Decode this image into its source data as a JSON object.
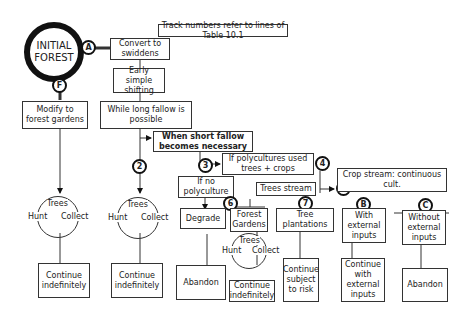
{
  "note": "Track numbers refer to lines of Table 10.1",
  "start": "INITIAL FOREST",
  "markers": {
    "A": "A",
    "F": "F",
    "n2": "2",
    "n3": "3",
    "n4": "4",
    "n5": "5",
    "n6": "6",
    "n7": "7",
    "B": "B",
    "C": "C"
  },
  "boxes": {
    "convert": "Convert to swiddens",
    "early": "Early simple shifting",
    "modify": "Modify to forest gardens",
    "long_fallow": "While long fallow is possible",
    "short_fallow": "When short fallow becomes necessary",
    "polycultures": "If polycultures used trees + crops",
    "no_poly": "If no polyculture",
    "trees_stream": "Trees stream",
    "crop_stream": "Crop stream: continuous cult.",
    "degrade": "Degrade",
    "forest_gardens": "Forest Gardens",
    "tree_plantations": "Tree plantations",
    "with_inputs": "With external inputs",
    "without_inputs": "Without external inputs",
    "continue1": "Continue indefinitely",
    "continue2": "Continue indefinitely",
    "abandon1": "Abandon",
    "continue3": "Continue indefinitely",
    "continue_risk": "Continue subject to risk",
    "continue_inputs": "Continue with external inputs",
    "abandon2": "Abandon"
  },
  "htc": {
    "trees": "Trees",
    "hunt": "Hunt",
    "collect": "Collect"
  }
}
